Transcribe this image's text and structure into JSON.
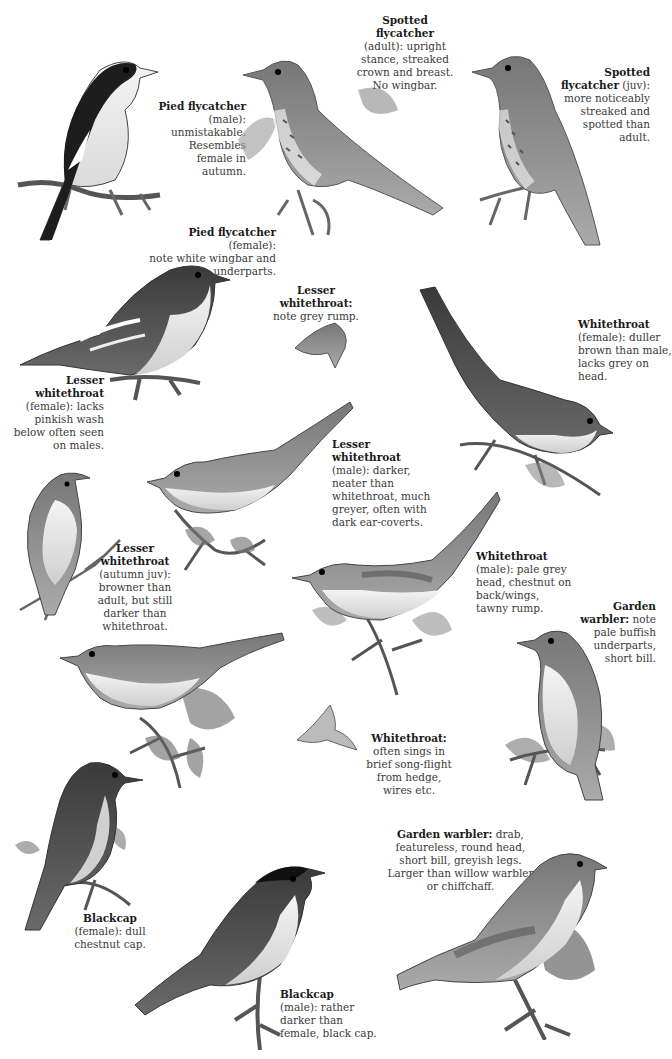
{
  "plate": {
    "style": "grayscale field-guide illustration",
    "colors": {
      "background": "#ffffff",
      "text": "#3a3a3a",
      "heading": "#1a1a1a"
    }
  },
  "captions": {
    "pied_male": {
      "name": "Pied flycatcher",
      "desc": [
        "(male):",
        "unmistakable.",
        "Resembles",
        "female in",
        "autumn."
      ]
    },
    "spotted_adult": {
      "name": [
        "Spotted",
        "flycatcher"
      ],
      "desc": [
        "(adult): upright",
        "stance, streaked",
        "crown and breast.",
        "No wingbar."
      ]
    },
    "spotted_juv": {
      "name": [
        "Spotted",
        "flycatcher"
      ],
      "desc_first": "(juv):",
      "desc": [
        "more noticeably",
        "streaked and",
        "spotted than",
        "adult."
      ]
    },
    "pied_female": {
      "name": "Pied flycatcher",
      "desc_first": "(female):",
      "desc": [
        "note white wingbar and",
        "underparts."
      ]
    },
    "lesser_rump": {
      "name": [
        "Lesser",
        "whitethroat:"
      ],
      "desc": [
        "note grey rump."
      ]
    },
    "lesser_female": {
      "name": [
        "Lesser",
        "whitethroat"
      ],
      "desc": [
        "(female): lacks",
        "pinkish wash",
        "below often seen",
        "on males."
      ]
    },
    "white_female": {
      "name": "Whitethroat",
      "desc": [
        "(female): duller",
        "brown than male,",
        "lacks grey on head."
      ]
    },
    "lesser_male": {
      "name": [
        "Lesser",
        "whitethroat"
      ],
      "desc": [
        "(male): darker,",
        "neater than",
        "whitethroat, much",
        "greyer, often with",
        "dark ear-coverts."
      ]
    },
    "lesser_juv": {
      "name": [
        "Lesser",
        "whitethroat"
      ],
      "desc": [
        "(autumn juv):",
        "browner than",
        "adult, but still",
        "darker than",
        "whitethroat."
      ]
    },
    "white_male": {
      "name": "Whitethroat",
      "desc": [
        "(male): pale grey",
        "head, chestnut on",
        "back/wings,",
        "tawny rump."
      ]
    },
    "garden_note": {
      "name": "Garden",
      "name2": "warbler:",
      "desc_first": "note",
      "desc": [
        "pale buffish",
        "underparts,",
        "short bill."
      ]
    },
    "white_flight": {
      "name": "Whitethroat:",
      "desc": [
        "often sings in",
        "brief song-flight",
        "from hedge,",
        "wires etc."
      ]
    },
    "garden_main": {
      "name": "Garden warbler:",
      "desc_first": "drab,",
      "desc": [
        "featureless, round head,",
        "short bill, greyish legs.",
        "Larger than willow warbler",
        "or chiffchaff."
      ]
    },
    "blackcap_female": {
      "name": "Blackcap",
      "desc": [
        "(female): dull",
        "chestnut cap."
      ]
    },
    "blackcap_male": {
      "name": "Blackcap",
      "desc": [
        "(male): rather",
        "darker than",
        "female, black cap."
      ]
    }
  },
  "illustrations": [
    {
      "id": "pied-flycatcher-male"
    },
    {
      "id": "spotted-flycatcher-adult"
    },
    {
      "id": "spotted-flycatcher-juv"
    },
    {
      "id": "pied-flycatcher-female"
    },
    {
      "id": "lesser-whitethroat-rump-flight"
    },
    {
      "id": "whitethroat-female"
    },
    {
      "id": "lesser-whitethroat-male"
    },
    {
      "id": "lesser-whitethroat-female"
    },
    {
      "id": "whitethroat-male"
    },
    {
      "id": "lesser-whitethroat-juv"
    },
    {
      "id": "garden-warbler-perched"
    },
    {
      "id": "whitethroat-song-flight"
    },
    {
      "id": "blackcap-female"
    },
    {
      "id": "blackcap-male"
    },
    {
      "id": "garden-warbler-main"
    }
  ]
}
